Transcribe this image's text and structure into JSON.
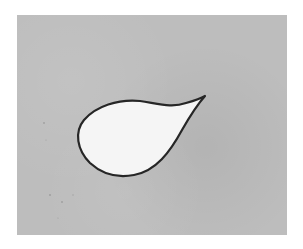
{
  "image": {
    "subject": "teardrop-shape-drawing",
    "background_color": "#ffffff",
    "panel_color": "#bdbdbd",
    "shape_fill": "#f4f4f4",
    "shape_stroke": "#2a2a2a"
  }
}
